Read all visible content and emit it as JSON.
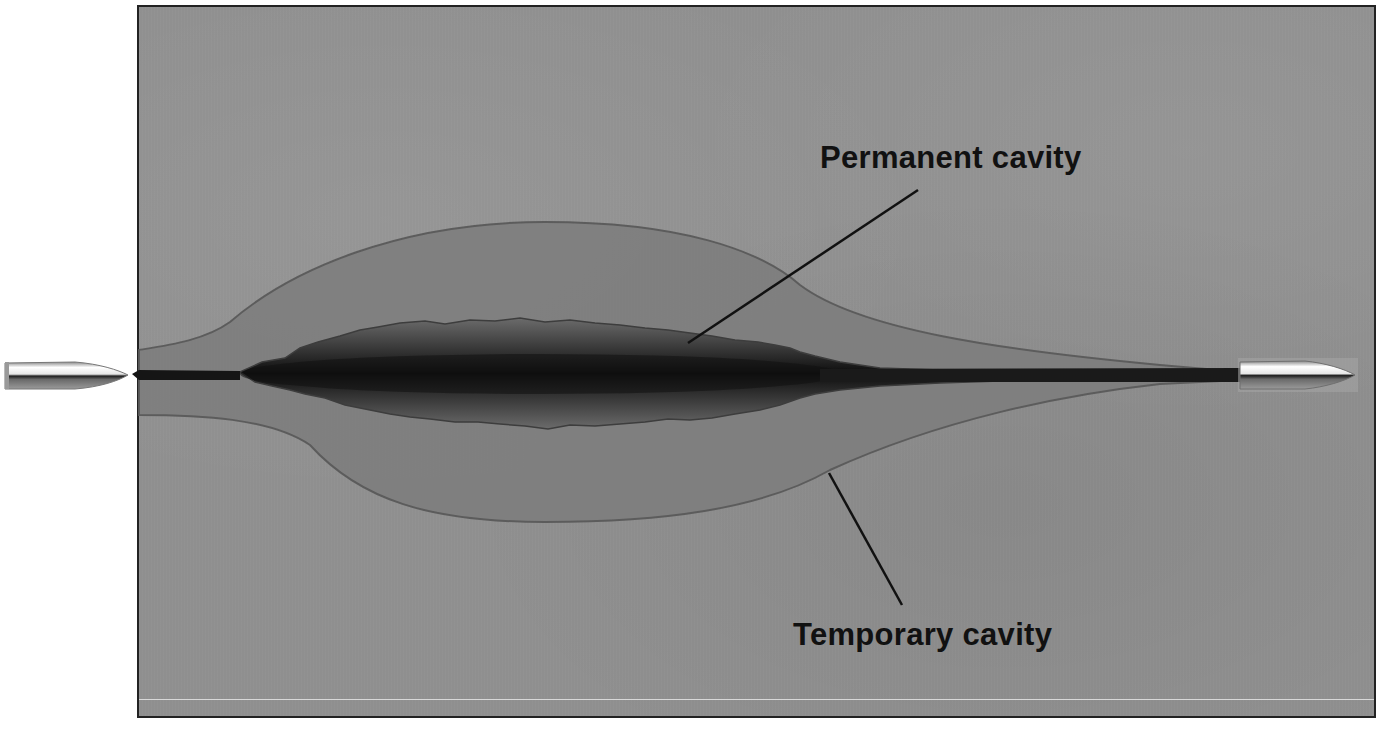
{
  "figure": {
    "labels": {
      "permanent_cavity": "Permanent cavity",
      "temporary_cavity": "Temporary cavity"
    },
    "elements": {
      "entry_bullet": "bullet-icon",
      "exit_bullet": "bullet-icon",
      "wound_track": "wound-track",
      "permanent_cavity_region": "permanent-cavity-shape",
      "temporary_cavity_region": "temporary-cavity-shape"
    },
    "colors": {
      "background": "#8f8f8f",
      "temporary_cavity_fill": "#7d7d7d",
      "permanent_cavity_core": "#1a1a1a",
      "outline": "#555555",
      "leader_line": "#111111",
      "text": "#111111",
      "frame_border": "#222222"
    }
  }
}
